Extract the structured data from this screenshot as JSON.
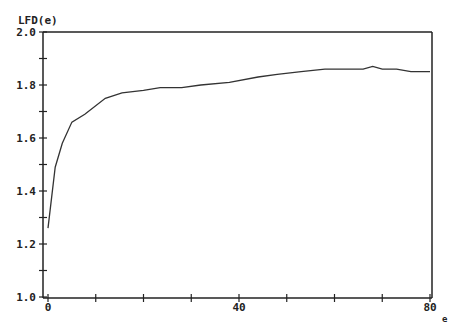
{
  "chart_data": {
    "type": "line",
    "title": "",
    "ylabel": "LFD(e)",
    "xlabel": "e",
    "xlim": [
      0,
      80
    ],
    "ylim": [
      1.0,
      2.0
    ],
    "grid": false,
    "legend": null,
    "x_ticks": [
      0,
      10,
      20,
      30,
      40,
      50,
      60,
      70,
      80
    ],
    "x_tick_labels": [
      {
        "value": 0,
        "label": "0"
      },
      {
        "value": 40,
        "label": "40"
      },
      {
        "value": 80,
        "label": "80"
      }
    ],
    "y_ticks": [
      1.0,
      1.1,
      1.2,
      1.3,
      1.4,
      1.5,
      1.6,
      1.7,
      1.8,
      1.9,
      2.0
    ],
    "y_tick_labels": [
      {
        "value": 1.0,
        "label": "1.0"
      },
      {
        "value": 1.2,
        "label": "1.2"
      },
      {
        "value": 1.4,
        "label": "1.4"
      },
      {
        "value": 1.6,
        "label": "1.6"
      },
      {
        "value": 1.8,
        "label": "1.8"
      },
      {
        "value": 2.0,
        "label": "2.0"
      }
    ],
    "series": [
      {
        "name": "LFD(e)",
        "color": "#333333",
        "x": [
          0,
          1.5,
          3,
          5,
          7.7,
          12,
          15.5,
          20,
          23.5,
          28,
          32,
          38,
          44,
          48,
          53,
          58,
          62,
          66,
          68,
          70,
          73,
          76,
          80
        ],
        "y": [
          1.26,
          1.49,
          1.58,
          1.66,
          1.69,
          1.75,
          1.77,
          1.78,
          1.79,
          1.79,
          1.8,
          1.81,
          1.83,
          1.84,
          1.85,
          1.86,
          1.86,
          1.86,
          1.87,
          1.86,
          1.86,
          1.85,
          1.85
        ]
      }
    ]
  }
}
